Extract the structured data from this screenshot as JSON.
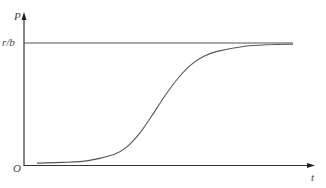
{
  "chart_data": {
    "type": "line",
    "title": "",
    "xlabel": "t",
    "ylabel": "P",
    "origin_label": "O",
    "asymptote": {
      "label": "r/b",
      "value": 1.0
    },
    "xlim": [
      0,
      1
    ],
    "ylim": [
      0,
      1.15
    ],
    "grid": false,
    "legend": null,
    "series": [
      {
        "name": "logistic P(t)",
        "x": [
          0.0,
          0.1,
          0.2,
          0.3,
          0.35,
          0.4,
          0.45,
          0.5,
          0.55,
          0.6,
          0.65,
          0.7,
          0.8,
          0.9,
          1.0
        ],
        "values": [
          0.02,
          0.025,
          0.04,
          0.09,
          0.15,
          0.26,
          0.41,
          0.57,
          0.71,
          0.82,
          0.89,
          0.93,
          0.97,
          0.985,
          0.99
        ]
      }
    ],
    "colors": {
      "axes": "#333333",
      "curve": "#555555",
      "asymptote": "#555555"
    }
  }
}
